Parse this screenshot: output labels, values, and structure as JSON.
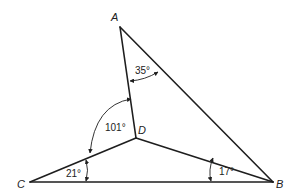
{
  "diagram": {
    "colors": {
      "line": "#1e1e1e",
      "text": "#222222",
      "background": "#ffffff"
    },
    "vertices": {
      "A": {
        "label": "A",
        "x": 120,
        "y": 27
      },
      "B": {
        "label": "B",
        "x": 273,
        "y": 182
      },
      "C": {
        "label": "C",
        "x": 30,
        "y": 182
      },
      "D": {
        "label": "D",
        "x": 136,
        "y": 138
      }
    },
    "segments": [
      "AB",
      "AD",
      "CD",
      "DB",
      "CB"
    ],
    "angles": [
      {
        "name": "angle-DAB",
        "label": "35°"
      },
      {
        "name": "angle-ADC",
        "label": "101°"
      },
      {
        "name": "angle-DCB",
        "label": "21°"
      },
      {
        "name": "angle-DBC",
        "label": "17°"
      }
    ]
  }
}
